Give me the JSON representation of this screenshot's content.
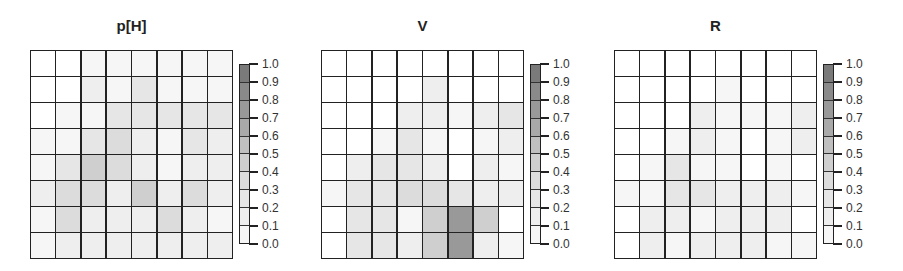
{
  "chart_data": [
    {
      "type": "heatmap",
      "title": "p[H]",
      "rows": 8,
      "cols": 8,
      "values": [
        [
          0.0,
          0.0,
          0.05,
          0.05,
          0.05,
          0.05,
          0.05,
          0.05
        ],
        [
          0.0,
          0.0,
          0.1,
          0.05,
          0.2,
          0.05,
          0.05,
          0.05
        ],
        [
          0.0,
          0.05,
          0.05,
          0.25,
          0.2,
          0.2,
          0.2,
          0.2
        ],
        [
          0.05,
          0.05,
          0.2,
          0.35,
          0.15,
          0.05,
          0.2,
          0.15
        ],
        [
          0.05,
          0.2,
          0.45,
          0.3,
          0.15,
          0.05,
          0.15,
          0.1
        ],
        [
          0.15,
          0.35,
          0.3,
          0.15,
          0.45,
          0.15,
          0.35,
          0.15
        ],
        [
          0.05,
          0.35,
          0.15,
          0.15,
          0.1,
          0.3,
          0.1,
          0.05
        ],
        [
          0.05,
          0.15,
          0.15,
          0.15,
          0.15,
          0.15,
          0.15,
          0.15
        ]
      ],
      "colorbar": {
        "min": 0.0,
        "max": 1.0,
        "ticks": [
          "0.0",
          "0.1",
          "0.2",
          "0.3",
          "0.4",
          "0.5",
          "0.6",
          "0.7",
          "0.8",
          "0.9",
          "1.0"
        ]
      },
      "grid": true
    },
    {
      "type": "heatmap",
      "title": "V",
      "rows": 8,
      "cols": 8,
      "values": [
        [
          0.0,
          0.0,
          0.0,
          0.0,
          0.0,
          0.0,
          0.0,
          0.0
        ],
        [
          0.0,
          0.0,
          0.0,
          0.0,
          0.1,
          0.0,
          0.0,
          0.0
        ],
        [
          0.0,
          0.0,
          0.0,
          0.15,
          0.15,
          0.05,
          0.15,
          0.2
        ],
        [
          0.0,
          0.0,
          0.05,
          0.2,
          0.05,
          0.0,
          0.05,
          0.15
        ],
        [
          0.0,
          0.1,
          0.2,
          0.2,
          0.15,
          0.0,
          0.1,
          0.05
        ],
        [
          0.05,
          0.2,
          0.2,
          0.35,
          0.3,
          0.2,
          0.15,
          0.15
        ],
        [
          0.0,
          0.2,
          0.2,
          0.05,
          0.45,
          0.75,
          0.45,
          0.0
        ],
        [
          0.0,
          0.2,
          0.25,
          0.15,
          0.4,
          0.75,
          0.15,
          0.05
        ]
      ],
      "colorbar": {
        "min": 0.0,
        "max": 1.0,
        "ticks": [
          "0.0",
          "0.1",
          "0.2",
          "0.3",
          "0.4",
          "0.5",
          "0.6",
          "0.7",
          "0.8",
          "0.9",
          "1.0"
        ]
      },
      "grid": true
    },
    {
      "type": "heatmap",
      "title": "R",
      "rows": 8,
      "cols": 8,
      "values": [
        [
          0.0,
          0.0,
          0.0,
          0.0,
          0.0,
          0.0,
          0.0,
          0.0
        ],
        [
          0.0,
          0.0,
          0.0,
          0.0,
          0.05,
          0.0,
          0.0,
          0.0
        ],
        [
          0.0,
          0.0,
          0.0,
          0.1,
          0.05,
          0.05,
          0.05,
          0.1
        ],
        [
          0.0,
          0.0,
          0.05,
          0.1,
          0.05,
          0.0,
          0.05,
          0.1
        ],
        [
          0.0,
          0.05,
          0.2,
          0.05,
          0.05,
          0.0,
          0.05,
          0.0
        ],
        [
          0.05,
          0.05,
          0.2,
          0.2,
          0.15,
          0.1,
          0.15,
          0.05
        ],
        [
          0.0,
          0.1,
          0.1,
          0.05,
          0.15,
          0.15,
          0.1,
          0.0
        ],
        [
          0.0,
          0.1,
          0.05,
          0.1,
          0.15,
          0.15,
          0.05,
          0.05
        ]
      ],
      "colorbar": {
        "min": 0.0,
        "max": 1.0,
        "ticks": [
          "0.0",
          "0.1",
          "0.2",
          "0.3",
          "0.4",
          "0.5",
          "0.6",
          "0.7",
          "0.8",
          "0.9",
          "1.0"
        ]
      },
      "grid": true
    }
  ],
  "palette": [
    "#f6f6f6",
    "#eeeeee",
    "#e6e6e6",
    "#dcdcdc",
    "#cfcfcf",
    "#bfbfbf",
    "#a9a9a9",
    "#999999",
    "#8a8a8a",
    "#7a7a7a"
  ],
  "panels": [
    {
      "title": "p[H]"
    },
    {
      "title": "V"
    },
    {
      "title": "R"
    }
  ]
}
